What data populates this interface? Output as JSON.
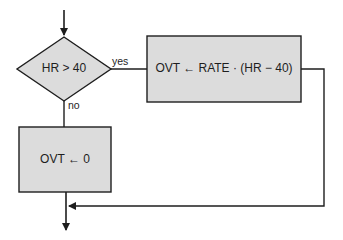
{
  "diagram": {
    "type": "flowchart",
    "colors": {
      "shape_fill": "#dcdcdc",
      "stroke": "#1e1e1e",
      "background": "#ffffff"
    },
    "nodes": [
      {
        "id": "decision",
        "shape": "diamond",
        "text": "HR > 40"
      },
      {
        "id": "overtime_calc",
        "shape": "process",
        "text": "OVT ← RATE · (HR − 40)"
      },
      {
        "id": "overtime_zero",
        "shape": "process",
        "text": "OVT ← 0"
      }
    ],
    "edges": [
      {
        "from": "entry",
        "to": "decision",
        "label": ""
      },
      {
        "from": "decision",
        "to": "overtime_calc",
        "label": "yes"
      },
      {
        "from": "decision",
        "to": "overtime_zero",
        "label": "no"
      },
      {
        "from": "overtime_calc",
        "to": "merge",
        "label": ""
      },
      {
        "from": "overtime_zero",
        "to": "exit",
        "label": ""
      }
    ]
  }
}
